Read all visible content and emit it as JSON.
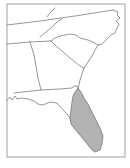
{
  "map": {
    "region": "Southeastern United States",
    "highlighted_region": "Florida peninsula",
    "colors": {
      "background": "#ffffff",
      "outline": "#6a6a6a",
      "frame": "#8a8a8a",
      "highlight_fill": "#b3b3b3"
    }
  }
}
